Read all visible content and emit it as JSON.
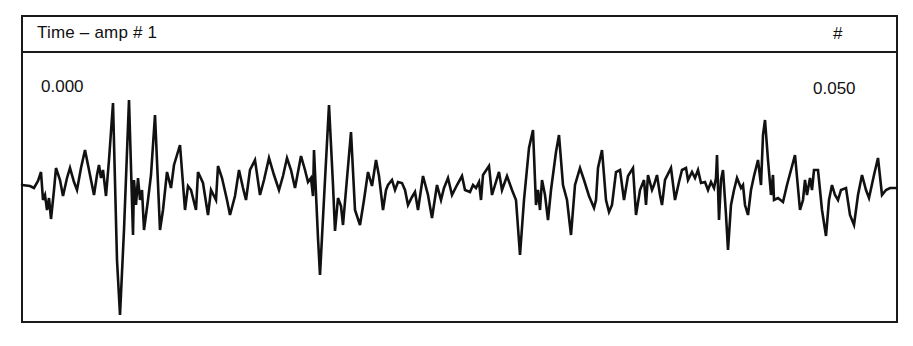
{
  "header": {
    "title": "Time – amp # 1",
    "marker": "#"
  },
  "axis": {
    "start_label": "0.000",
    "end_label": "0.050"
  },
  "chart_data": {
    "type": "line",
    "title": "Time – amp # 1",
    "xlabel": "Time",
    "ylabel": "Amplitude",
    "xlim": [
      0.0,
      0.05
    ],
    "x_tick_labels": [
      "0.000",
      "0.050"
    ],
    "grid": false,
    "legend": null,
    "series": [
      {
        "name": "amp # 1",
        "color": "#111111",
        "points_px": [
          [
            22,
            185
          ],
          [
            30,
            186
          ],
          [
            34,
            188
          ],
          [
            38,
            181
          ],
          [
            41,
            172
          ],
          [
            43,
            200
          ],
          [
            45,
            195
          ],
          [
            47,
            210
          ],
          [
            49,
            198
          ],
          [
            51,
            219
          ],
          [
            54,
            190
          ],
          [
            56,
            168
          ],
          [
            60,
            180
          ],
          [
            63,
            196
          ],
          [
            67,
            178
          ],
          [
            70,
            168
          ],
          [
            74,
            182
          ],
          [
            77,
            190
          ],
          [
            81,
            168
          ],
          [
            85,
            150
          ],
          [
            89,
            170
          ],
          [
            94,
            195
          ],
          [
            97,
            175
          ],
          [
            99,
            165
          ],
          [
            101,
            178
          ],
          [
            103,
            170
          ],
          [
            106,
            196
          ],
          [
            109,
            160
          ],
          [
            113,
            103
          ],
          [
            117,
            260
          ],
          [
            120,
            315
          ],
          [
            124,
            230
          ],
          [
            129,
            100
          ],
          [
            133,
            235
          ],
          [
            134,
            180
          ],
          [
            136,
            205
          ],
          [
            138,
            178
          ],
          [
            140,
            200
          ],
          [
            142,
            190
          ],
          [
            144,
            230
          ],
          [
            148,
            200
          ],
          [
            151,
            175
          ],
          [
            155,
            115
          ],
          [
            160,
            230
          ],
          [
            163,
            210
          ],
          [
            167,
            172
          ],
          [
            171,
            188
          ],
          [
            174,
            165
          ],
          [
            180,
            145
          ],
          [
            185,
            210
          ],
          [
            188,
            186
          ],
          [
            191,
            190
          ],
          [
            196,
            210
          ],
          [
            198,
            172
          ],
          [
            203,
            183
          ],
          [
            208,
            215
          ],
          [
            211,
            190
          ],
          [
            216,
            200
          ],
          [
            218,
            166
          ],
          [
            222,
            178
          ],
          [
            227,
            200
          ],
          [
            230,
            215
          ],
          [
            235,
            196
          ],
          [
            239,
            170
          ],
          [
            243,
            188
          ],
          [
            246,
            200
          ],
          [
            250,
            170
          ],
          [
            255,
            160
          ],
          [
            260,
            195
          ],
          [
            264,
            180
          ],
          [
            269,
            158
          ],
          [
            274,
            175
          ],
          [
            279,
            190
          ],
          [
            283,
            176
          ],
          [
            287,
            158
          ],
          [
            291,
            170
          ],
          [
            295,
            188
          ],
          [
            301,
            156
          ],
          [
            305,
            170
          ],
          [
            308,
            182
          ],
          [
            311,
            178
          ],
          [
            313,
            196
          ],
          [
            314,
            150
          ],
          [
            318,
            238
          ],
          [
            320,
            275
          ],
          [
            325,
            180
          ],
          [
            329,
            105
          ],
          [
            333,
            185
          ],
          [
            335,
            231
          ],
          [
            338,
            198
          ],
          [
            341,
            206
          ],
          [
            343,
            225
          ],
          [
            346,
            190
          ],
          [
            351,
            132
          ],
          [
            355,
            210
          ],
          [
            360,
            225
          ],
          [
            364,
            200
          ],
          [
            368,
            172
          ],
          [
            372,
            186
          ],
          [
            376,
            160
          ],
          [
            379,
            176
          ],
          [
            383,
            210
          ],
          [
            386,
            190
          ],
          [
            388,
            185
          ],
          [
            392,
            180
          ],
          [
            395,
            190
          ],
          [
            398,
            182
          ],
          [
            402,
            183
          ],
          [
            405,
            190
          ],
          [
            408,
            205
          ],
          [
            412,
            197
          ],
          [
            415,
            192
          ],
          [
            418,
            210
          ],
          [
            423,
            176
          ],
          [
            428,
            195
          ],
          [
            432,
            218
          ],
          [
            437,
            185
          ],
          [
            441,
            200
          ],
          [
            444,
            188
          ],
          [
            448,
            178
          ],
          [
            452,
            195
          ],
          [
            457,
            185
          ],
          [
            462,
            176
          ],
          [
            465,
            190
          ],
          [
            470,
            192
          ],
          [
            473,
            185
          ],
          [
            476,
            188
          ],
          [
            479,
            182
          ],
          [
            481,
            200
          ],
          [
            483,
            175
          ],
          [
            489,
            166
          ],
          [
            492,
            195
          ],
          [
            495,
            185
          ],
          [
            499,
            172
          ],
          [
            502,
            190
          ],
          [
            507,
            176
          ],
          [
            512,
            190
          ],
          [
            516,
            200
          ],
          [
            520,
            255
          ],
          [
            524,
            200
          ],
          [
            529,
            148
          ],
          [
            533,
            130
          ],
          [
            536,
            205
          ],
          [
            538,
            190
          ],
          [
            540,
            210
          ],
          [
            542,
            180
          ],
          [
            545,
            195
          ],
          [
            548,
            220
          ],
          [
            551,
            190
          ],
          [
            556,
            152
          ],
          [
            559,
            135
          ],
          [
            563,
            185
          ],
          [
            567,
            200
          ],
          [
            571,
            235
          ],
          [
            575,
            185
          ],
          [
            580,
            168
          ],
          [
            584,
            180
          ],
          [
            589,
            196
          ],
          [
            594,
            208
          ],
          [
            596,
            200
          ],
          [
            598,
            168
          ],
          [
            602,
            150
          ],
          [
            606,
            200
          ],
          [
            609,
            212
          ],
          [
            612,
            205
          ],
          [
            616,
            172
          ],
          [
            620,
            170
          ],
          [
            624,
            200
          ],
          [
            628,
            176
          ],
          [
            633,
            168
          ],
          [
            636,
            215
          ],
          [
            640,
            190
          ],
          [
            644,
            180
          ],
          [
            646,
            205
          ],
          [
            648,
            175
          ],
          [
            652,
            190
          ],
          [
            654,
            185
          ],
          [
            657,
            175
          ],
          [
            660,
            195
          ],
          [
            662,
            205
          ],
          [
            665,
            180
          ],
          [
            671,
            168
          ],
          [
            675,
            200
          ],
          [
            679,
            182
          ],
          [
            682,
            170
          ],
          [
            686,
            168
          ],
          [
            688,
            180
          ],
          [
            692,
            172
          ],
          [
            695,
            178
          ],
          [
            698,
            170
          ],
          [
            701,
            183
          ],
          [
            705,
            182
          ],
          [
            708,
            190
          ],
          [
            711,
            182
          ],
          [
            714,
            188
          ],
          [
            716,
            178
          ],
          [
            717,
            155
          ],
          [
            719,
            220
          ],
          [
            721,
            180
          ],
          [
            723,
            170
          ],
          [
            726,
            215
          ],
          [
            728,
            250
          ],
          [
            731,
            205
          ],
          [
            734,
            190
          ],
          [
            737,
            178
          ],
          [
            741,
            188
          ],
          [
            743,
            185
          ],
          [
            745,
            205
          ],
          [
            748,
            215
          ],
          [
            751,
            190
          ],
          [
            754,
            176
          ],
          [
            758,
            160
          ],
          [
            761,
            185
          ],
          [
            763,
            135
          ],
          [
            765,
            120
          ],
          [
            768,
            160
          ],
          [
            771,
            195
          ],
          [
            773,
            175
          ],
          [
            774,
            200
          ],
          [
            778,
            198
          ],
          [
            783,
            202
          ],
          [
            787,
            185
          ],
          [
            791,
            170
          ],
          [
            795,
            155
          ],
          [
            800,
            210
          ],
          [
            803,
            200
          ],
          [
            805,
            180
          ],
          [
            807,
            195
          ],
          [
            810,
            178
          ],
          [
            812,
            190
          ],
          [
            814,
            170
          ],
          [
            818,
            170
          ],
          [
            822,
            210
          ],
          [
            826,
            236
          ],
          [
            829,
            200
          ],
          [
            832,
            185
          ],
          [
            835,
            195
          ],
          [
            838,
            200
          ],
          [
            841,
            190
          ],
          [
            846,
            188
          ],
          [
            850,
            215
          ],
          [
            854,
            225
          ],
          [
            858,
            195
          ],
          [
            862,
            175
          ],
          [
            866,
            190
          ],
          [
            869,
            198
          ],
          [
            874,
            175
          ],
          [
            878,
            158
          ],
          [
            882,
            195
          ],
          [
            886,
            190
          ],
          [
            890,
            188
          ],
          [
            896,
            188
          ]
        ]
      }
    ],
    "annotations": [
      "0.000 (left, start time)",
      "0.050 (right, end time)"
    ]
  }
}
